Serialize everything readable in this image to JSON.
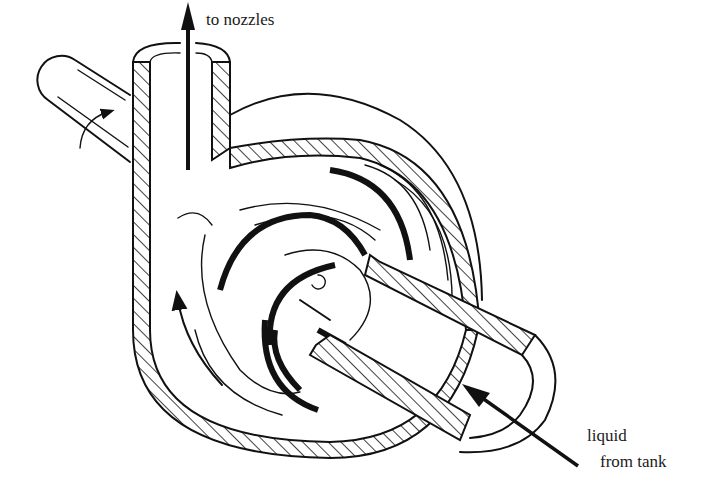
{
  "figure": {
    "labels": {
      "outlet": "to nozzles",
      "inlet_line1": "liquid",
      "inlet_line2": "from tank"
    },
    "icons": {
      "outlet_arrow": "arrow-up-icon",
      "inlet_arrow": "arrow-up-left-icon",
      "flow_arrows": "curved-arrow-icon"
    },
    "colors": {
      "line": "#111111",
      "background": "#ffffff"
    }
  }
}
